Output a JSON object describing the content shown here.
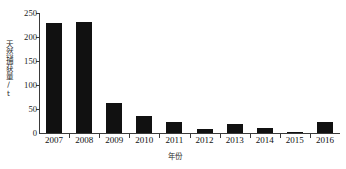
{
  "chart_data": {
    "type": "bar",
    "title": "",
    "xlabel": "年份",
    "ylabel": "天然捕获量/t",
    "categories": [
      "2007",
      "2008",
      "2009",
      "2010",
      "2011",
      "2012",
      "2013",
      "2014",
      "2015",
      "2016"
    ],
    "values": [
      230,
      232,
      63,
      35,
      23,
      8,
      18,
      10,
      3,
      23
    ],
    "ylim": [
      0,
      250
    ],
    "yticks": [
      0,
      50,
      100,
      150,
      200,
      250
    ],
    "ytick_labels": [
      "0",
      "50",
      "100",
      "150",
      "200",
      "250"
    ],
    "grid": false,
    "legend": false,
    "legend_position": "none",
    "bar_color": "#111111",
    "axis_color": "#3a3a3a",
    "series": [
      {
        "name": "天然捕获量",
        "values": [
          230,
          232,
          63,
          35,
          23,
          8,
          18,
          10,
          3,
          23
        ]
      }
    ]
  }
}
